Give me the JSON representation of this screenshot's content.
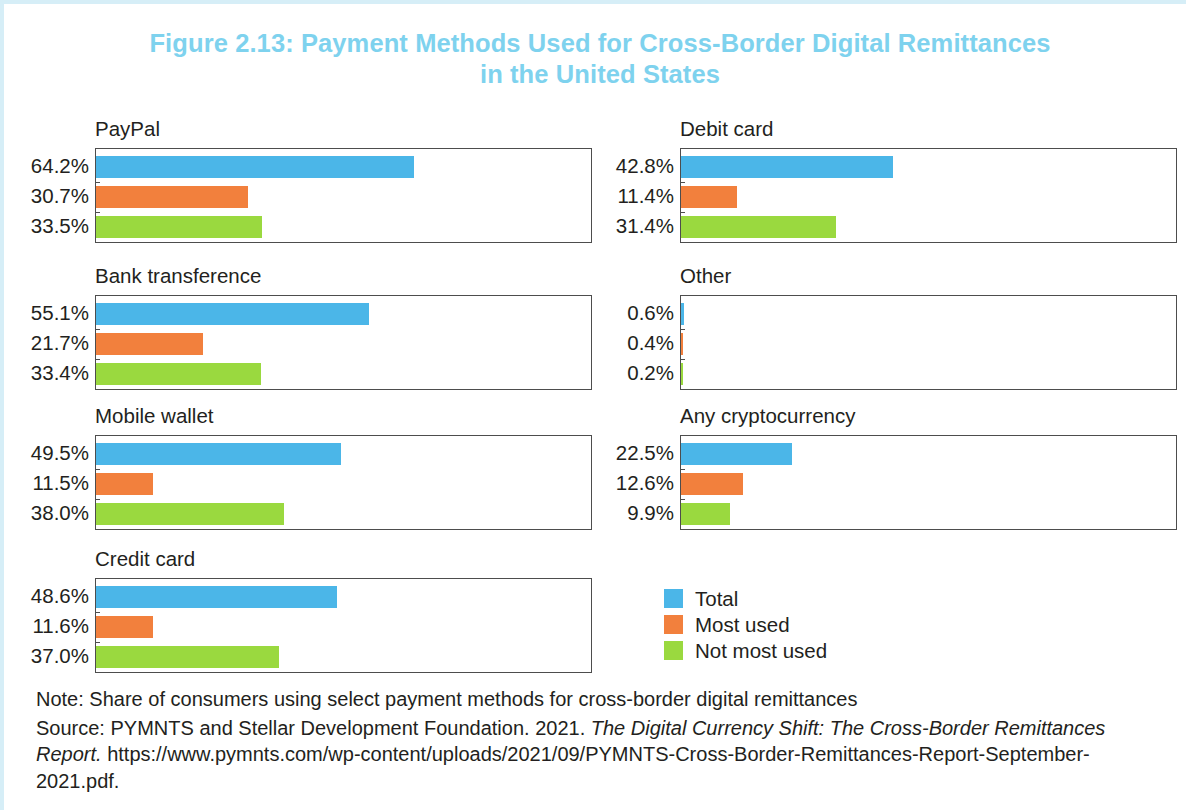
{
  "title": {
    "line1": "Figure 2.13: Payment Methods Used for Cross-Border Digital Remittances",
    "line2": "in the United States",
    "color": "#7ed2ee"
  },
  "legend": {
    "items": [
      {
        "label": "Total",
        "color": "#4bb6e8"
      },
      {
        "label": "Most used",
        "color": "#f2803d"
      },
      {
        "label": "Not most used",
        "color": "#9ad93f"
      }
    ]
  },
  "notes": {
    "note": "Note: Share of consumers using select payment methods for cross-border digital remittances",
    "source_prefix": "Source: PYMNTS and Stellar Development Foundation. 2021. ",
    "source_title": "The Digital Currency Shift: The Cross-Border Remittances Report.",
    "source_url": " https://www.pymnts.com/wp-content/uploads/2021/09/PYMNTS-Cross-Border-Remittances-Report-September-2021.pdf."
  },
  "chart_data": {
    "type": "bar",
    "title": "Figure 2.13: Payment Methods Used for Cross-Border Digital Remittances in the United States",
    "subtitle": "",
    "xlabel": "",
    "ylabel": "",
    "xlim": [
      0,
      100
    ],
    "grid": false,
    "legend_position": "bottom-right",
    "orientation": "horizontal",
    "value_unit": "%",
    "series_names": [
      "Total",
      "Most used",
      "Not most used"
    ],
    "series_colors": [
      "#4bb6e8",
      "#f2803d",
      "#9ad93f"
    ],
    "panels": [
      {
        "name": "PayPal",
        "categories": [
          "Total",
          "Most used",
          "Not most used"
        ],
        "values": [
          64.2,
          30.7,
          33.5
        ],
        "labels": [
          "64.2%",
          "30.7%",
          "33.5%"
        ]
      },
      {
        "name": "Debit card",
        "categories": [
          "Total",
          "Most used",
          "Not most used"
        ],
        "values": [
          42.8,
          11.4,
          31.4
        ],
        "labels": [
          "42.8%",
          "11.4%",
          "31.4%"
        ]
      },
      {
        "name": "Bank transference",
        "categories": [
          "Total",
          "Most used",
          "Not most used"
        ],
        "values": [
          55.1,
          21.7,
          33.4
        ],
        "labels": [
          "55.1%",
          "21.7%",
          "33.4%"
        ]
      },
      {
        "name": "Other",
        "categories": [
          "Total",
          "Most used",
          "Not most used"
        ],
        "values": [
          0.6,
          0.4,
          0.2
        ],
        "labels": [
          "0.6%",
          "0.4%",
          "0.2%"
        ]
      },
      {
        "name": "Mobile wallet",
        "categories": [
          "Total",
          "Most used",
          "Not most used"
        ],
        "values": [
          49.5,
          11.5,
          38.0
        ],
        "labels": [
          "49.5%",
          "11.5%",
          "38.0%"
        ]
      },
      {
        "name": "Any cryptocurrency",
        "categories": [
          "Total",
          "Most used",
          "Not most used"
        ],
        "values": [
          22.5,
          12.6,
          9.9
        ],
        "labels": [
          "22.5%",
          "12.6%",
          "9.9%"
        ]
      },
      {
        "name": "Credit card",
        "categories": [
          "Total",
          "Most used",
          "Not most used"
        ],
        "values": [
          48.6,
          11.6,
          37.0
        ],
        "labels": [
          "48.6%",
          "11.6%",
          "37.0%"
        ]
      }
    ]
  }
}
